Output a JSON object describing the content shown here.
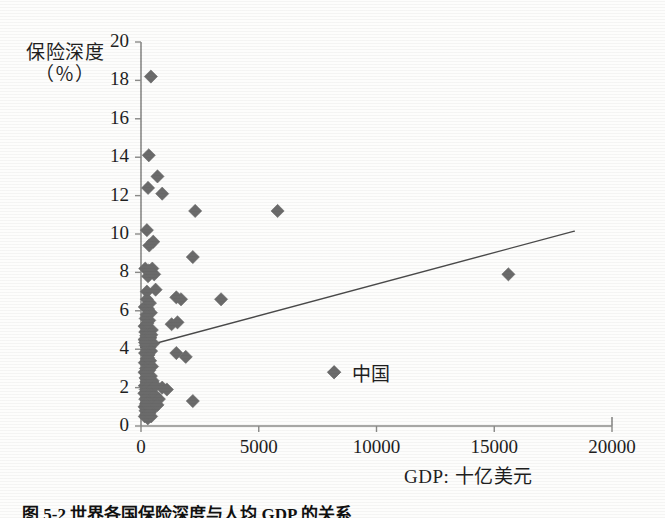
{
  "figure": {
    "background_color": "#fdfdfc",
    "axis_color": "#8a8a88",
    "marker_color": "#6b6b6b",
    "trendline_color": "#4a4a4a",
    "text_color": "#1f1f1f",
    "caption": "图 5-2 世界各国保险深度与人均 GDP 的关系"
  },
  "chart_data": {
    "type": "scatter",
    "title": "",
    "subtitle": "",
    "xlabel": "GDP: 十亿美元",
    "ylabel_line1": "保险深度",
    "ylabel_line2": "（％）",
    "ylabel": "保险深度（％）",
    "xlim": [
      0,
      20000
    ],
    "ylim": [
      0,
      20
    ],
    "xticks": [
      0,
      5000,
      10000,
      15000,
      20000
    ],
    "xtick_labels": [
      "0",
      "5000",
      "10000",
      "15000",
      "20000"
    ],
    "yticks": [
      0,
      2,
      4,
      6,
      8,
      10,
      12,
      14,
      16,
      18,
      20
    ],
    "ytick_labels": [
      "0",
      "2",
      "4",
      "6",
      "8",
      "10",
      "12",
      "14",
      "16",
      "18",
      "20"
    ],
    "grid": false,
    "legend": null,
    "marker_shape": "diamond",
    "marker_size": 9,
    "series": [
      {
        "name": "各国保险深度",
        "marker": "diamond",
        "color": "#6b6b6b",
        "points": [
          [
            420,
            18.2
          ],
          [
            330,
            14.1
          ],
          [
            700,
            13.0
          ],
          [
            300,
            12.4
          ],
          [
            900,
            12.1
          ],
          [
            2300,
            11.2
          ],
          [
            5800,
            11.2
          ],
          [
            250,
            10.2
          ],
          [
            520,
            9.6
          ],
          [
            350,
            9.4
          ],
          [
            2200,
            8.8
          ],
          [
            15600,
            7.9
          ],
          [
            180,
            8.2
          ],
          [
            330,
            8.1
          ],
          [
            480,
            8.2
          ],
          [
            560,
            7.9
          ],
          [
            300,
            7.8
          ],
          [
            430,
            8.0
          ],
          [
            250,
            7.0
          ],
          [
            620,
            7.1
          ],
          [
            1500,
            6.7
          ],
          [
            1700,
            6.6
          ],
          [
            3400,
            6.6
          ],
          [
            160,
            6.2
          ],
          [
            300,
            6.1
          ],
          [
            420,
            5.9
          ],
          [
            240,
            5.8
          ],
          [
            1300,
            5.3
          ],
          [
            1550,
            5.4
          ],
          [
            200,
            5.6
          ],
          [
            350,
            5.5
          ],
          [
            150,
            5.2
          ],
          [
            280,
            5.1
          ],
          [
            460,
            5.0
          ],
          [
            180,
            4.9
          ],
          [
            330,
            4.8
          ],
          [
            220,
            4.7
          ],
          [
            400,
            4.6
          ],
          [
            150,
            4.5
          ],
          [
            300,
            4.4
          ],
          [
            520,
            4.3
          ],
          [
            200,
            4.2
          ],
          [
            360,
            4.1
          ],
          [
            260,
            4.0
          ],
          [
            430,
            3.9
          ],
          [
            170,
            3.8
          ],
          [
            320,
            3.7
          ],
          [
            1500,
            3.8
          ],
          [
            1900,
            3.6
          ],
          [
            240,
            3.5
          ],
          [
            390,
            3.4
          ],
          [
            160,
            3.3
          ],
          [
            300,
            3.2
          ],
          [
            470,
            3.1
          ],
          [
            210,
            3.0
          ],
          [
            350,
            2.9
          ],
          [
            8200,
            2.8
          ],
          [
            150,
            2.8
          ],
          [
            280,
            2.7
          ],
          [
            420,
            2.6
          ],
          [
            190,
            2.5
          ],
          [
            340,
            2.4
          ],
          [
            230,
            2.3
          ],
          [
            450,
            2.2
          ],
          [
            160,
            2.1
          ],
          [
            300,
            2.0
          ],
          [
            900,
            2.0
          ],
          [
            1100,
            1.9
          ],
          [
            200,
            1.9
          ],
          [
            380,
            1.8
          ],
          [
            2200,
            1.3
          ],
          [
            140,
            1.7
          ],
          [
            290,
            1.6
          ],
          [
            460,
            1.5
          ],
          [
            180,
            1.4
          ],
          [
            330,
            1.3
          ],
          [
            240,
            1.2
          ],
          [
            410,
            1.1
          ],
          [
            150,
            1.0
          ],
          [
            300,
            0.9
          ],
          [
            520,
            0.9
          ],
          [
            190,
            0.8
          ],
          [
            350,
            0.7
          ],
          [
            230,
            0.6
          ],
          [
            430,
            0.5
          ],
          [
            160,
            0.5
          ],
          [
            290,
            0.4
          ],
          [
            600,
            1.6
          ],
          [
            760,
            1.4
          ],
          [
            250,
            6.6
          ],
          [
            380,
            6.4
          ],
          [
            170,
            4.35
          ],
          [
            300,
            3.55
          ],
          [
            500,
            2.35
          ],
          [
            210,
            1.15
          ],
          [
            340,
            0.65
          ],
          [
            270,
            5.35
          ],
          [
            440,
            4.75
          ],
          [
            200,
            2.75
          ],
          [
            620,
            2.1
          ],
          [
            700,
            1.1
          ]
        ]
      }
    ],
    "annotations": [
      {
        "label": "中国",
        "x": 8200,
        "y": 2.8,
        "marker": "diamond",
        "marker_color": "#6b6b6b"
      }
    ],
    "trendline": {
      "type": "linear",
      "x_start": 0,
      "y_start": 4.1,
      "x_end": 18400,
      "y_end": 10.15,
      "color": "#4a4a4a",
      "width": 1.4
    }
  }
}
